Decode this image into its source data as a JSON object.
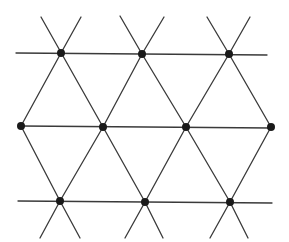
{
  "diagram": {
    "type": "triangular-lattice",
    "background": "#ffffff",
    "line_color": "#3a3a3a",
    "node_color": "#1a1a1a",
    "node_radius": 4,
    "nodes": [
      {
        "id": "t1",
        "x": 61,
        "y": 53
      },
      {
        "id": "t2",
        "x": 142,
        "y": 54
      },
      {
        "id": "t3",
        "x": 229,
        "y": 54
      },
      {
        "id": "m1",
        "x": 21,
        "y": 126
      },
      {
        "id": "m2",
        "x": 103,
        "y": 127
      },
      {
        "id": "m3",
        "x": 186,
        "y": 127
      },
      {
        "id": "m4",
        "x": 271,
        "y": 127
      },
      {
        "id": "b1",
        "x": 60,
        "y": 201
      },
      {
        "id": "b2",
        "x": 145,
        "y": 202
      },
      {
        "id": "b3",
        "x": 230,
        "y": 202
      }
    ],
    "lines": [
      {
        "x1": 16,
        "y1": 53,
        "x2": 267,
        "y2": 55
      },
      {
        "x1": 21,
        "y1": 126,
        "x2": 271,
        "y2": 128
      },
      {
        "x1": 18,
        "y1": 201,
        "x2": 272,
        "y2": 203
      },
      {
        "x1": 41,
        "y1": 17,
        "x2": 103,
        "y2": 127
      },
      {
        "x1": 103,
        "y1": 127,
        "x2": 145,
        "y2": 202
      },
      {
        "x1": 145,
        "y1": 202,
        "x2": 163,
        "y2": 238
      },
      {
        "x1": 81,
        "y1": 17,
        "x2": 61,
        "y2": 53
      },
      {
        "x1": 61,
        "y1": 53,
        "x2": 21,
        "y2": 126
      },
      {
        "x1": 120,
        "y1": 16,
        "x2": 142,
        "y2": 54
      },
      {
        "x1": 142,
        "y1": 54,
        "x2": 186,
        "y2": 127
      },
      {
        "x1": 186,
        "y1": 127,
        "x2": 230,
        "y2": 202
      },
      {
        "x1": 230,
        "y1": 202,
        "x2": 248,
        "y2": 238
      },
      {
        "x1": 164,
        "y1": 17,
        "x2": 142,
        "y2": 54
      },
      {
        "x1": 142,
        "y1": 54,
        "x2": 103,
        "y2": 127
      },
      {
        "x1": 103,
        "y1": 127,
        "x2": 60,
        "y2": 201
      },
      {
        "x1": 60,
        "y1": 201,
        "x2": 40,
        "y2": 238
      },
      {
        "x1": 207,
        "y1": 17,
        "x2": 229,
        "y2": 54
      },
      {
        "x1": 229,
        "y1": 54,
        "x2": 271,
        "y2": 127
      },
      {
        "x1": 250,
        "y1": 17,
        "x2": 229,
        "y2": 54
      },
      {
        "x1": 229,
        "y1": 54,
        "x2": 186,
        "y2": 127
      },
      {
        "x1": 186,
        "y1": 127,
        "x2": 145,
        "y2": 202
      },
      {
        "x1": 145,
        "y1": 202,
        "x2": 125,
        "y2": 238
      },
      {
        "x1": 21,
        "y1": 126,
        "x2": 60,
        "y2": 201
      },
      {
        "x1": 60,
        "y1": 201,
        "x2": 80,
        "y2": 238
      },
      {
        "x1": 271,
        "y1": 127,
        "x2": 230,
        "y2": 202
      },
      {
        "x1": 230,
        "y1": 202,
        "x2": 210,
        "y2": 238
      }
    ]
  }
}
